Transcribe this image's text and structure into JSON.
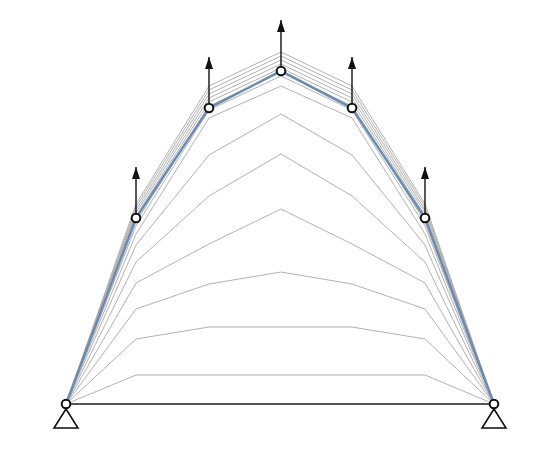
{
  "diagram": {
    "title": "",
    "colors": {
      "background": "#ffffff",
      "iteration_line": "#a8a8a8",
      "final_shape": "#6f97c8",
      "members": "#1a1a1a",
      "node_fill": "#ffffff",
      "node_stroke": "#111111",
      "arrow": "#111111"
    },
    "supports": [
      {
        "name": "left-support",
        "type": "pinned",
        "x": 66,
        "y": 404
      },
      {
        "name": "right-support",
        "type": "pinned",
        "x": 494,
        "y": 404
      }
    ],
    "nodes_x": [
      66,
      136,
      209,
      281,
      352,
      425,
      494
    ],
    "final_shape_y": [
      404,
      218,
      108,
      71,
      108,
      218,
      404
    ],
    "loaded_nodes": [
      {
        "x": 136,
        "y": 218
      },
      {
        "x": 209,
        "y": 108
      },
      {
        "x": 281,
        "y": 71
      },
      {
        "x": 352,
        "y": 108
      },
      {
        "x": 425,
        "y": 218
      }
    ],
    "load_arrow_length": 46,
    "load_direction": "up",
    "iterations_y": [
      [
        404,
        375,
        375,
        375,
        375,
        375,
        404
      ],
      [
        404,
        339,
        327,
        327,
        327,
        339,
        404
      ],
      [
        404,
        309,
        284,
        272,
        284,
        309,
        404
      ],
      [
        404,
        283,
        244,
        209,
        244,
        283,
        404
      ],
      [
        404,
        262,
        196,
        154,
        196,
        262,
        404
      ],
      [
        404,
        245,
        155,
        114,
        155,
        245,
        404
      ],
      [
        404,
        234,
        118,
        86,
        118,
        234,
        404
      ],
      [
        404,
        226,
        110,
        76,
        110,
        226,
        404
      ],
      [
        404,
        222,
        106,
        72,
        106,
        222,
        404
      ],
      [
        404,
        216,
        102,
        68,
        102,
        216,
        404
      ],
      [
        404,
        213,
        98,
        64,
        98,
        213,
        404
      ],
      [
        404,
        210,
        94,
        60,
        94,
        210,
        404
      ],
      [
        404,
        207,
        90,
        56,
        90,
        207,
        404
      ],
      [
        404,
        204,
        86,
        52,
        86,
        204,
        404
      ]
    ],
    "base_line": {
      "x1": 66,
      "y1": 404,
      "x2": 494,
      "y2": 404
    }
  }
}
